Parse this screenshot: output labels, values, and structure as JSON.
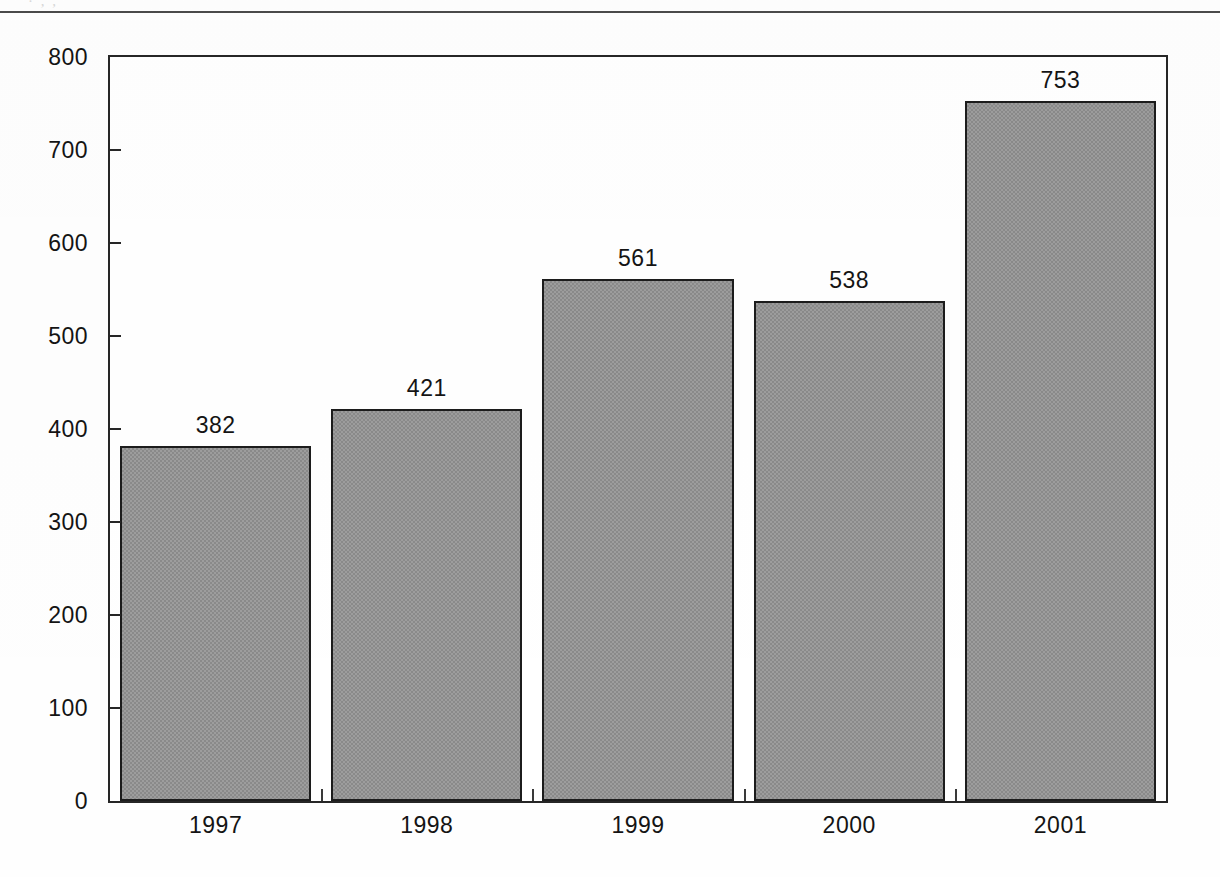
{
  "page": {
    "clipped_header_text": "· , ,",
    "background_color": "#ffffff"
  },
  "chart_data": {
    "type": "bar",
    "title": "",
    "subtitle": "",
    "xlabel": "",
    "ylabel": "",
    "categories": [
      "1997",
      "1998",
      "1999",
      "2000",
      "2001"
    ],
    "values": [
      382,
      421,
      561,
      538,
      753
    ],
    "value_labels": [
      "382",
      "421",
      "561",
      "538",
      "753"
    ],
    "series": [
      {
        "name": "",
        "values": [
          382,
          421,
          561,
          538,
          753
        ]
      }
    ],
    "ylim": [
      0,
      800
    ],
    "y_ticks": [
      0,
      100,
      200,
      300,
      400,
      500,
      600,
      700,
      800
    ],
    "y_tick_labels": [
      "0",
      "100",
      "200",
      "300",
      "400",
      "500",
      "600",
      "700",
      "800"
    ],
    "grid": false,
    "legend": false,
    "legend_position": "none",
    "bar_fill_color": "#9d9d9d",
    "bar_border_color": "#1c1c1c",
    "axis_color": "#262626",
    "text_color": "#141414",
    "tick_direction": "inward",
    "data_labels_shown": true
  }
}
